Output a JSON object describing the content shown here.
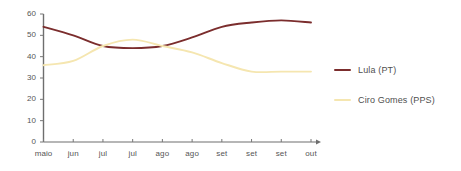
{
  "chart_data": {
    "type": "line",
    "title": "",
    "xlabel": "",
    "ylabel": "",
    "ylim": [
      0,
      60
    ],
    "yticks": [
      0,
      10,
      20,
      30,
      40,
      50,
      60
    ],
    "grid": false,
    "legend_position": "right",
    "categories": [
      "maio",
      "jun",
      "jul",
      "jul",
      "ago",
      "ago",
      "set",
      "set",
      "set",
      "out"
    ],
    "series": [
      {
        "name": "Lula (PT)",
        "color": "#7B2D2D",
        "values": [
          54,
          50,
          45,
          44,
          45,
          49,
          54,
          56,
          57,
          56
        ]
      },
      {
        "name": "Ciro Gomes (PPS)",
        "color": "#F5E6B0",
        "values": [
          36,
          38,
          45,
          48,
          45,
          42,
          37,
          33,
          33,
          33
        ]
      }
    ]
  },
  "axis": {
    "tick_color": "#777777",
    "line_color": "#6e6e6e",
    "label_color": "#555555"
  },
  "legend": {
    "entries": [
      {
        "label": "Lula (PT)",
        "color": "#7B2D2D"
      },
      {
        "label": "Ciro Gomes (PPS)",
        "color": "#F5E6B0"
      }
    ]
  }
}
